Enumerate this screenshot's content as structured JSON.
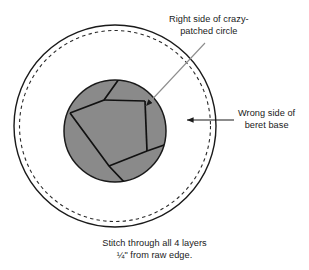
{
  "diagram": {
    "labels": {
      "top": {
        "line1": "Right side of crazy-",
        "line2": "patched circle"
      },
      "right": {
        "line1": "Wrong side of",
        "line2": "beret base"
      }
    },
    "caption": {
      "line1": "Stitch through all 4 layers",
      "line2": "¼\" from raw edge."
    },
    "colors": {
      "stroke": "#1a1a1a",
      "patch_fill": "#8a8a8a",
      "leader": "#7a7a7a",
      "background": "#ffffff"
    },
    "shapes": {
      "outer_circle": {
        "cx": 115,
        "cy": 126,
        "r": 101,
        "style": "solid",
        "name": "beret-base-raw-edge"
      },
      "dashed_circle": {
        "cx": 115,
        "cy": 126,
        "r": 96,
        "style": "dashed",
        "name": "stitching-line"
      },
      "patched_circle": {
        "cx": 115,
        "cy": 131,
        "r": 51,
        "style": "solid-filled",
        "name": "crazy-patched-circle"
      }
    },
    "patch_seams": [
      {
        "name": "seam-1",
        "points": "118,80 104,100 72,112"
      },
      {
        "name": "seam-2",
        "points": "104,100 144,101"
      },
      {
        "name": "seam-3",
        "points": "144,101 146,150"
      },
      {
        "name": "seam-4",
        "points": "146,150 166,144"
      },
      {
        "name": "seam-5",
        "points": "72,112 108,165 124,182"
      },
      {
        "name": "seam-6",
        "points": "108,165 146,150"
      }
    ],
    "leader_top": {
      "from": "204,42",
      "to": "143,108",
      "arrow": true
    },
    "arrow_right": {
      "from": "233,120",
      "to": "185,120",
      "arrow": true
    }
  }
}
